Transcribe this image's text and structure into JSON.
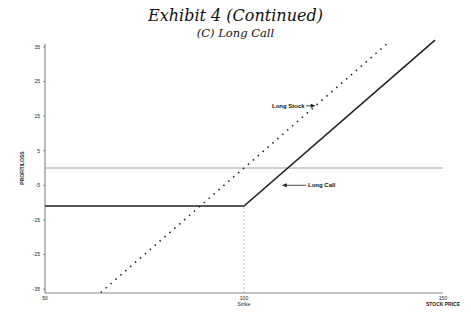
{
  "header": {
    "title": "Exhibit 4 (Continued)",
    "subtitle": "(C) Long Call"
  },
  "chart_data": {
    "type": "line",
    "title": "Exhibit 4 (Continued)",
    "subtitle": "(C) Long Call",
    "xlabel": "STOCK PRICE",
    "ylabel": "PROFIT/LOSS",
    "xlim": [
      50,
      150
    ],
    "ylim": [
      -36,
      36
    ],
    "x_ticks": [
      {
        "value": 50,
        "label": "50"
      },
      {
        "value": 100,
        "label": "100",
        "sublabel": "Strike"
      },
      {
        "value": 150,
        "label": "150"
      }
    ],
    "y_ticks": [
      35,
      25,
      15,
      5,
      -5,
      -15,
      -25,
      -35
    ],
    "grid": false,
    "reference_lines": [
      {
        "type": "horizontal",
        "y": 0,
        "style": "thin"
      },
      {
        "type": "vertical",
        "x": 100,
        "style": "dashed",
        "from_y": -36,
        "to_y": -11
      }
    ],
    "series": [
      {
        "name": "Long Call",
        "style": "solid-thick",
        "x": [
          50,
          100,
          148
        ],
        "y": [
          -11,
          -11,
          37
        ]
      },
      {
        "name": "Long Stock",
        "style": "dotted",
        "x": [
          64,
          136
        ],
        "y": [
          -36,
          36
        ]
      }
    ],
    "annotations": [
      {
        "text": "Long Stock",
        "arrow_to": {
          "x": 118,
          "y": 18
        }
      },
      {
        "text": "Long Call",
        "arrow_to": {
          "x": 109,
          "y": -5
        }
      }
    ]
  }
}
